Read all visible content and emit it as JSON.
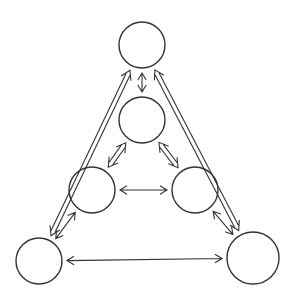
{
  "diagram": {
    "type": "triangular network of six nodes",
    "stroke_color": "#333333",
    "background": "#ffffff",
    "nodes": [
      {
        "id": "top",
        "cx": 142,
        "cy": 45,
        "r": 23
      },
      {
        "id": "upper-middle",
        "cx": 142,
        "cy": 120,
        "r": 23
      },
      {
        "id": "middle-left",
        "cx": 92,
        "cy": 190,
        "r": 23
      },
      {
        "id": "middle-right",
        "cx": 195,
        "cy": 190,
        "r": 23
      },
      {
        "id": "bottom-left",
        "cx": 39,
        "cy": 261,
        "r": 23
      },
      {
        "id": "bottom-right",
        "cx": 253,
        "cy": 258,
        "r": 26
      }
    ],
    "edges": [
      {
        "from": "top",
        "to": "upper-middle",
        "style": "single-double-headed"
      },
      {
        "from": "upper-middle",
        "to": "middle-left",
        "style": "hollow-double-headed"
      },
      {
        "from": "upper-middle",
        "to": "middle-right",
        "style": "hollow-double-headed"
      },
      {
        "from": "middle-left",
        "to": "middle-right",
        "style": "single-double-headed"
      },
      {
        "from": "middle-left",
        "to": "bottom-left",
        "style": "single-double-headed"
      },
      {
        "from": "middle-right",
        "to": "bottom-right",
        "style": "single-double-headed"
      },
      {
        "from": "bottom-left",
        "to": "bottom-right",
        "style": "single-double-headed"
      },
      {
        "from": "top",
        "to": "bottom-left",
        "style": "hollow-double-headed"
      },
      {
        "from": "top",
        "to": "bottom-right",
        "style": "hollow-double-headed"
      }
    ]
  }
}
